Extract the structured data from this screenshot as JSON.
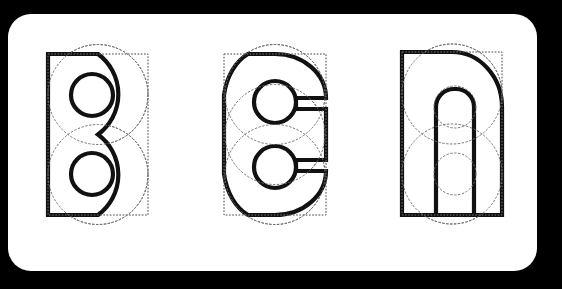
{
  "figure": {
    "kind": "letterform-construction-diagram",
    "background_color": "#000000",
    "card_color": "#ffffff",
    "card_corner_radius": "23",
    "ink_color": "#111111",
    "guide_color": "#7d7d7d",
    "construction_color": "#6e6e6e"
  },
  "glyphs": [
    {
      "id": "glyph-b",
      "character": "B",
      "label": "B",
      "description": "Capital B built from two stacked circles with a straight left stem and two circular counters",
      "box": {
        "x": 40,
        "y": 40,
        "width": 100,
        "height": 161
      },
      "stem_x": 40,
      "counters": 2,
      "construction_circles": 2
    },
    {
      "id": "glyph-c",
      "character": "C",
      "label": "C",
      "description": "Capital C built from a large circle with horizontal terminals cut into the right side and two circular counters",
      "box": {
        "x": 216,
        "y": 40,
        "width": 102,
        "height": 161
      },
      "stem_x": 216,
      "counters": 2,
      "construction_circles": 3
    },
    {
      "id": "glyph-n",
      "character": "N",
      "label": "N",
      "description": "Letter n built from a square left stem, an arched rounded top right, and a rectangular counter with rounded top",
      "box": {
        "x": 394,
        "y": 38,
        "width": 100,
        "height": 163
      },
      "stem_x": 394,
      "counters": 1,
      "construction_circles": 2
    }
  ],
  "canvas": {
    "width": "529",
    "height": "257"
  }
}
